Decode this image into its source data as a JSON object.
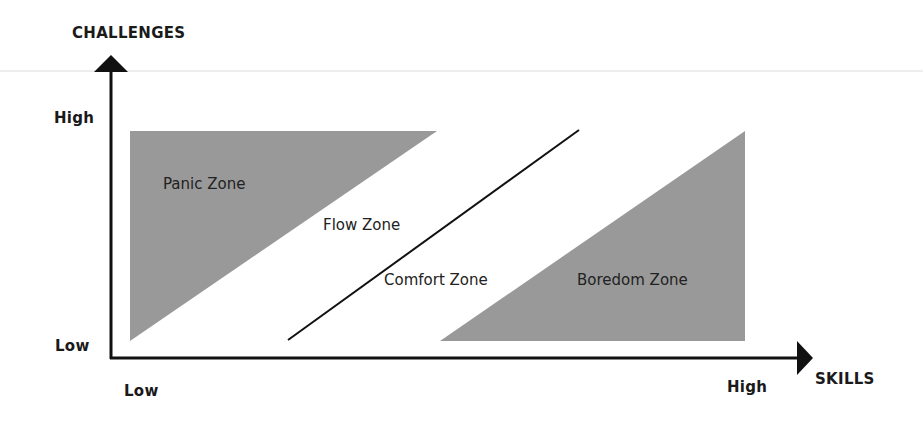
{
  "diagram": {
    "y_axis": {
      "label": "CHALLENGES",
      "high": "High",
      "low": "Low"
    },
    "x_axis": {
      "label": "SKILLS",
      "high": "High",
      "low": "Low"
    },
    "zones": [
      {
        "name": "Panic Zone",
        "shape": "triangle",
        "fill": "#999999"
      },
      {
        "name": "Flow Zone",
        "shape": "band"
      },
      {
        "name": "Comfort Zone",
        "shape": "band"
      },
      {
        "name": "Boredom Zone",
        "shape": "triangle",
        "fill": "#999999"
      }
    ],
    "colors": {
      "zone_fill": "#999999",
      "axis": "#111111",
      "rule": "#dddddd"
    }
  }
}
